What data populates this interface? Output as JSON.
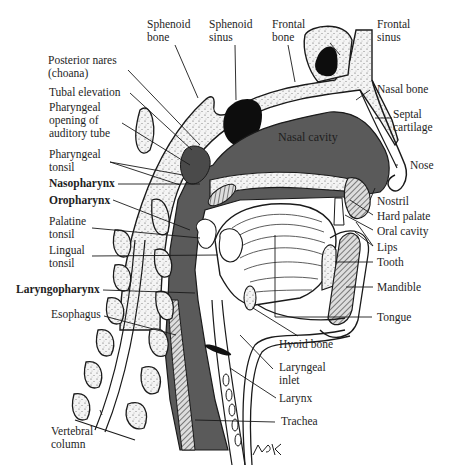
{
  "figure": {
    "signature": "RBK",
    "colors": {
      "cavity": "#5a5a5a",
      "bone_fill": "#f2f2f2",
      "outline": "#1a1a1a",
      "sinus": "#0d0d0d",
      "background": "#ffffff"
    }
  },
  "labels": {
    "sphenoid_bone": [
      "Sphenoid",
      "bone"
    ],
    "sphenoid_sinus": [
      "Sphenoid",
      "sinus"
    ],
    "frontal_bone": [
      "Frontal",
      "bone"
    ],
    "frontal_sinus": [
      "Frontal",
      "sinus"
    ],
    "posterior_nares": [
      "Posterior nares",
      "(choana)"
    ],
    "tubal_elevation": "Tubal elevation",
    "pharyngeal_opening": [
      "Pharyngeal",
      "opening of",
      "auditory tube"
    ],
    "pharyngeal_tonsil": [
      "Pharyngeal",
      "tonsil"
    ],
    "nasopharynx": "Nasopharynx",
    "oropharynx": "Oropharynx",
    "palatine_tonsil": [
      "Palatine",
      "tonsil"
    ],
    "lingual_tonsil": [
      "Lingual",
      "tonsil"
    ],
    "laryngopharynx": "Laryngopharynx",
    "esophagus": "Esophagus",
    "vertebral_column": [
      "Vertebral",
      "column"
    ],
    "nasal_cavity": "Nasal cavity",
    "nasal_bone": "Nasal bone",
    "septal_cartilage": [
      "Septal",
      "cartilage"
    ],
    "nose": "Nose",
    "nostril": "Nostril",
    "hard_palate": "Hard palate",
    "oral_cavity": "Oral cavity",
    "lips": "Lips",
    "tooth": "Tooth",
    "mandible": "Mandible",
    "tongue": "Tongue",
    "hyoid_bone": "Hyoid bone",
    "laryngeal_inlet": [
      "Laryngeal",
      "inlet"
    ],
    "larynx": "Larynx",
    "trachea": "Trachea"
  }
}
